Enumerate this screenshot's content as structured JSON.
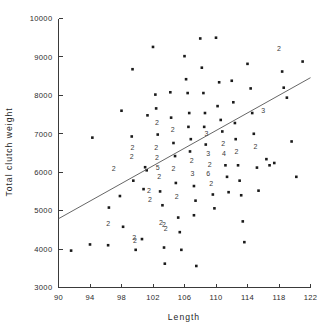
{
  "chart_data": {
    "type": "scatter",
    "title": "",
    "xlabel": "Length",
    "ylabel": "Total clutch weight",
    "xlim": [
      90,
      122
    ],
    "ylim": [
      3000,
      10000
    ],
    "xticks": [
      90,
      94,
      98,
      102,
      106,
      110,
      114,
      118,
      122
    ],
    "yticks": [
      3000,
      4000,
      5000,
      6000,
      7000,
      8000,
      9000,
      10000
    ],
    "xtick_labels": [
      "90",
      "94",
      "98",
      "102",
      "106",
      "110",
      "114",
      "118",
      "122"
    ],
    "ytick_labels": [
      "3000",
      "4000",
      "5000",
      "6000",
      "7000",
      "8000",
      "9000",
      "10000"
    ],
    "grid": false,
    "legend": false,
    "marker": "filled-square-dot",
    "overplot_notation": "digits indicate number of coincident observations",
    "trend_line": {
      "type": "linear-regression",
      "x_start": 90,
      "y_start": 4790,
      "x_end": 122,
      "y_end": 8460
    },
    "points": [
      {
        "x": 91.6,
        "y": 3960,
        "n": 1
      },
      {
        "x": 94.0,
        "y": 4120,
        "n": 1
      },
      {
        "x": 96.3,
        "y": 4100,
        "n": 1
      },
      {
        "x": 96.4,
        "y": 5080,
        "n": 1
      },
      {
        "x": 96.3,
        "y": 4640,
        "n": 2
      },
      {
        "x": 94.3,
        "y": 6900,
        "n": 1
      },
      {
        "x": 97.0,
        "y": 6090,
        "n": 2
      },
      {
        "x": 98.0,
        "y": 7600,
        "n": 1
      },
      {
        "x": 97.8,
        "y": 5380,
        "n": 1
      },
      {
        "x": 98.2,
        "y": 4580,
        "n": 1
      },
      {
        "x": 99.4,
        "y": 8680,
        "n": 1
      },
      {
        "x": 99.3,
        "y": 6930,
        "n": 1
      },
      {
        "x": 99.4,
        "y": 6620,
        "n": 2
      },
      {
        "x": 99.3,
        "y": 6380,
        "n": 2
      },
      {
        "x": 99.5,
        "y": 5780,
        "n": 1
      },
      {
        "x": 99.6,
        "y": 4280,
        "n": 2
      },
      {
        "x": 99.7,
        "y": 4200,
        "n": 2
      },
      {
        "x": 99.8,
        "y": 3980,
        "n": 1
      },
      {
        "x": 100.8,
        "y": 5560,
        "n": 1
      },
      {
        "x": 100.6,
        "y": 4260,
        "n": 1
      },
      {
        "x": 101.0,
        "y": 6130,
        "n": 1
      },
      {
        "x": 101.3,
        "y": 7480,
        "n": 1
      },
      {
        "x": 101.2,
        "y": 6050,
        "n": 1
      },
      {
        "x": 101.5,
        "y": 5520,
        "n": 2
      },
      {
        "x": 101.6,
        "y": 5280,
        "n": 2
      },
      {
        "x": 102.0,
        "y": 9260,
        "n": 1
      },
      {
        "x": 102.3,
        "y": 8020,
        "n": 1
      },
      {
        "x": 102.4,
        "y": 7660,
        "n": 1
      },
      {
        "x": 102.5,
        "y": 7280,
        "n": 2
      },
      {
        "x": 102.6,
        "y": 6980,
        "n": 1
      },
      {
        "x": 102.4,
        "y": 6620,
        "n": 2
      },
      {
        "x": 102.5,
        "y": 6360,
        "n": 2
      },
      {
        "x": 102.6,
        "y": 6100,
        "n": 5
      },
      {
        "x": 102.8,
        "y": 5860,
        "n": 2
      },
      {
        "x": 102.9,
        "y": 5500,
        "n": 1
      },
      {
        "x": 103.2,
        "y": 5140,
        "n": 1
      },
      {
        "x": 103.0,
        "y": 4680,
        "n": 2
      },
      {
        "x": 103.4,
        "y": 4620,
        "n": 2
      },
      {
        "x": 103.6,
        "y": 4520,
        "n": 2
      },
      {
        "x": 103.4,
        "y": 4040,
        "n": 1
      },
      {
        "x": 103.5,
        "y": 3620,
        "n": 1
      },
      {
        "x": 104.2,
        "y": 8080,
        "n": 1
      },
      {
        "x": 104.3,
        "y": 7420,
        "n": 1
      },
      {
        "x": 104.5,
        "y": 7100,
        "n": 2
      },
      {
        "x": 104.6,
        "y": 6760,
        "n": 1
      },
      {
        "x": 104.8,
        "y": 6420,
        "n": 1
      },
      {
        "x": 104.6,
        "y": 6080,
        "n": 2
      },
      {
        "x": 104.9,
        "y": 5720,
        "n": 1
      },
      {
        "x": 105.0,
        "y": 5340,
        "n": 2
      },
      {
        "x": 105.2,
        "y": 4820,
        "n": 1
      },
      {
        "x": 105.4,
        "y": 4440,
        "n": 1
      },
      {
        "x": 105.6,
        "y": 3980,
        "n": 1
      },
      {
        "x": 106.0,
        "y": 9020,
        "n": 1
      },
      {
        "x": 106.2,
        "y": 8420,
        "n": 1
      },
      {
        "x": 106.4,
        "y": 8060,
        "n": 1
      },
      {
        "x": 106.6,
        "y": 7540,
        "n": 1
      },
      {
        "x": 106.5,
        "y": 7180,
        "n": 1
      },
      {
        "x": 106.8,
        "y": 6860,
        "n": 1
      },
      {
        "x": 106.7,
        "y": 6540,
        "n": 1
      },
      {
        "x": 106.9,
        "y": 6280,
        "n": 2
      },
      {
        "x": 107.0,
        "y": 5960,
        "n": 3
      },
      {
        "x": 107.2,
        "y": 5640,
        "n": 1
      },
      {
        "x": 107.4,
        "y": 5260,
        "n": 1
      },
      {
        "x": 107.2,
        "y": 4880,
        "n": 1
      },
      {
        "x": 107.5,
        "y": 3560,
        "n": 1
      },
      {
        "x": 108.0,
        "y": 9480,
        "n": 1
      },
      {
        "x": 108.2,
        "y": 8720,
        "n": 1
      },
      {
        "x": 108.4,
        "y": 8060,
        "n": 1
      },
      {
        "x": 108.6,
        "y": 7540,
        "n": 1
      },
      {
        "x": 108.5,
        "y": 7180,
        "n": 1
      },
      {
        "x": 108.8,
        "y": 6980,
        "n": 3
      },
      {
        "x": 108.7,
        "y": 6720,
        "n": 1
      },
      {
        "x": 109.0,
        "y": 6460,
        "n": 3
      },
      {
        "x": 109.2,
        "y": 6180,
        "n": 2
      },
      {
        "x": 109.0,
        "y": 5940,
        "n": 6
      },
      {
        "x": 109.4,
        "y": 5700,
        "n": 2
      },
      {
        "x": 109.6,
        "y": 5420,
        "n": 1
      },
      {
        "x": 109.8,
        "y": 5060,
        "n": 1
      },
      {
        "x": 110.0,
        "y": 9500,
        "n": 1
      },
      {
        "x": 110.4,
        "y": 8340,
        "n": 1
      },
      {
        "x": 110.2,
        "y": 7720,
        "n": 1
      },
      {
        "x": 110.6,
        "y": 7360,
        "n": 1
      },
      {
        "x": 110.8,
        "y": 7060,
        "n": 1
      },
      {
        "x": 110.9,
        "y": 6740,
        "n": 2
      },
      {
        "x": 111.0,
        "y": 6460,
        "n": 4
      },
      {
        "x": 111.2,
        "y": 6180,
        "n": 1
      },
      {
        "x": 111.4,
        "y": 5880,
        "n": 1
      },
      {
        "x": 111.6,
        "y": 5480,
        "n": 1
      },
      {
        "x": 112.0,
        "y": 8380,
        "n": 1
      },
      {
        "x": 112.2,
        "y": 7820,
        "n": 1
      },
      {
        "x": 112.4,
        "y": 7280,
        "n": 1
      },
      {
        "x": 112.5,
        "y": 6860,
        "n": 1
      },
      {
        "x": 112.6,
        "y": 6520,
        "n": 2
      },
      {
        "x": 112.8,
        "y": 6180,
        "n": 1
      },
      {
        "x": 113.0,
        "y": 5780,
        "n": 1
      },
      {
        "x": 113.2,
        "y": 5400,
        "n": 1
      },
      {
        "x": 113.4,
        "y": 4720,
        "n": 1
      },
      {
        "x": 113.6,
        "y": 4180,
        "n": 1
      },
      {
        "x": 114.0,
        "y": 8820,
        "n": 1
      },
      {
        "x": 114.4,
        "y": 8180,
        "n": 1
      },
      {
        "x": 114.6,
        "y": 7540,
        "n": 1
      },
      {
        "x": 114.8,
        "y": 7000,
        "n": 1
      },
      {
        "x": 115.0,
        "y": 6640,
        "n": 2
      },
      {
        "x": 115.2,
        "y": 6120,
        "n": 1
      },
      {
        "x": 115.4,
        "y": 5520,
        "n": 1
      },
      {
        "x": 116.0,
        "y": 7580,
        "n": 3
      },
      {
        "x": 116.4,
        "y": 6340,
        "n": 1
      },
      {
        "x": 116.8,
        "y": 6180,
        "n": 1
      },
      {
        "x": 117.4,
        "y": 6240,
        "n": 1
      },
      {
        "x": 118.0,
        "y": 9200,
        "n": 2
      },
      {
        "x": 118.4,
        "y": 8620,
        "n": 1
      },
      {
        "x": 118.6,
        "y": 8200,
        "n": 1
      },
      {
        "x": 119.0,
        "y": 7940,
        "n": 1
      },
      {
        "x": 119.6,
        "y": 6800,
        "n": 1
      },
      {
        "x": 120.2,
        "y": 5880,
        "n": 1
      },
      {
        "x": 121.0,
        "y": 8880,
        "n": 1
      }
    ]
  }
}
